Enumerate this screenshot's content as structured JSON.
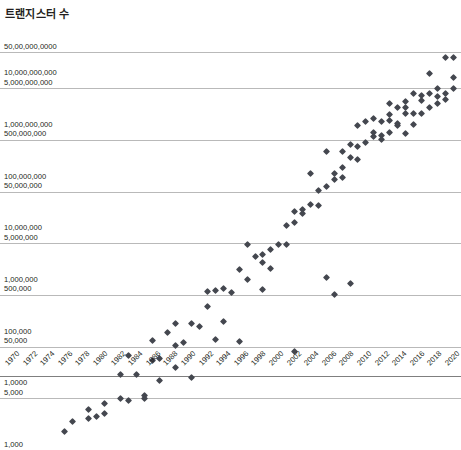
{
  "chart_data": {
    "type": "scatter",
    "title": "트랜지스터 수",
    "xlabel": "",
    "ylabel": "",
    "grid": true,
    "legend": null,
    "y_scale": "log",
    "ylim": [
      1000,
      50000000000
    ],
    "xlim": [
      1970,
      2021
    ],
    "y_tick_labels": [
      "50,00,000,0000",
      "10,000,000,000",
      "5,000,000,000",
      "1,000,000,000",
      "500,000,000",
      "100,000,000",
      "50,000,000",
      "10,000,000",
      "5,000,000",
      "1,000,000",
      "500,000",
      "100,000",
      "50,000",
      "1,0000",
      "5,000",
      "1,000"
    ],
    "y_gridline_values": [
      50000000000,
      10000000000,
      1000000000,
      100000000,
      10000000,
      1000000,
      100000,
      10000
    ],
    "x_tick_labels": [
      "1970",
      "1972",
      "1974",
      "1976",
      "1978",
      "1980",
      "1982",
      "1984",
      "1986",
      "1988",
      "1990",
      "1992",
      "1994",
      "1996",
      "1998",
      "2000",
      "2002",
      "2004",
      "2006",
      "2008",
      "2010",
      "2012",
      "2014",
      "2016",
      "2018",
      "2020"
    ],
    "marker": "diamond",
    "marker_color": "#44474f",
    "points": [
      [
        1971,
        2300
      ],
      [
        1972,
        3500
      ],
      [
        1974,
        4100
      ],
      [
        1974,
        6000
      ],
      [
        1975,
        4500
      ],
      [
        1976,
        8000
      ],
      [
        1976,
        5000
      ],
      [
        1978,
        29000
      ],
      [
        1979,
        9000
      ],
      [
        1979,
        68000
      ],
      [
        1980,
        29000
      ],
      [
        1981,
        11500
      ],
      [
        1982,
        134000
      ],
      [
        1982,
        55000
      ],
      [
        1983,
        22000
      ],
      [
        1984,
        190000
      ],
      [
        1985,
        275000
      ],
      [
        1986,
        120000
      ],
      [
        1987,
        25000
      ],
      [
        1988,
        250000
      ],
      [
        1989,
        1180000
      ],
      [
        1989,
        600000
      ],
      [
        1990,
        1200000
      ],
      [
        1991,
        1350000
      ],
      [
        1992,
        1100000
      ],
      [
        1993,
        3100000
      ],
      [
        1994,
        2000000
      ],
      [
        1994,
        9300000
      ],
      [
        1995,
        5500000
      ],
      [
        1996,
        4300000
      ],
      [
        1996,
        6000000
      ],
      [
        1997,
        7500000
      ],
      [
        1998,
        9500000
      ],
      [
        1999,
        9500000
      ],
      [
        1999,
        22000000
      ],
      [
        2000,
        42000000
      ],
      [
        2000,
        25000000
      ],
      [
        2001,
        45000000
      ],
      [
        2001,
        37500000
      ],
      [
        2002,
        55000000
      ],
      [
        2002,
        220000000
      ],
      [
        2003,
        105000000
      ],
      [
        2003,
        54000000
      ],
      [
        2004,
        592000000
      ],
      [
        2004,
        125000000
      ],
      [
        2005,
        228000000
      ],
      [
        2005,
        169000000
      ],
      [
        2006,
        291000000
      ],
      [
        2006,
        184000000
      ],
      [
        2006,
        582000000
      ],
      [
        2007,
        805000000
      ],
      [
        2007,
        463000000
      ],
      [
        2008,
        731000000
      ],
      [
        2008,
        411000000
      ],
      [
        2008,
        1900000000
      ],
      [
        2009,
        904000000
      ],
      [
        2009,
        2300000000
      ],
      [
        2010,
        1170000000
      ],
      [
        2010,
        2600000000
      ],
      [
        2010,
        1400000000
      ],
      [
        2011,
        2270000000
      ],
      [
        2011,
        1200000000
      ],
      [
        2011,
        995000000
      ],
      [
        2012,
        3100000000
      ],
      [
        2012,
        1400000000
      ],
      [
        2012,
        2400000000
      ],
      [
        2012,
        5000000000
      ],
      [
        2013,
        4310000000
      ],
      [
        2013,
        1860000000
      ],
      [
        2013,
        2100000000
      ],
      [
        2014,
        5560000000
      ],
      [
        2014,
        4200000000
      ],
      [
        2014,
        3200000000
      ],
      [
        2014,
        1300000000
      ],
      [
        2015,
        3300000000
      ],
      [
        2015,
        8000000000
      ],
      [
        2015,
        2000000000
      ],
      [
        2016,
        7200000000
      ],
      [
        2016,
        3300000000
      ],
      [
        2016,
        5700000000
      ],
      [
        2017,
        19200000000
      ],
      [
        2017,
        8000000000
      ],
      [
        2017,
        4300000000
      ],
      [
        2018,
        10000000000
      ],
      [
        2018,
        6900000000
      ],
      [
        2018,
        5000000000
      ],
      [
        2019,
        39540000000
      ],
      [
        2019,
        8000000000
      ],
      [
        2019,
        6000000000
      ],
      [
        2020,
        39500000000
      ],
      [
        2020,
        10000000000
      ],
      [
        2020,
        16000000000
      ],
      [
        1985,
        40000
      ],
      [
        1990,
        140000
      ],
      [
        1993,
        125000
      ],
      [
        2000,
        80000
      ],
      [
        1987,
        275000
      ],
      [
        1991,
        310000
      ],
      [
        1996,
        1300000
      ],
      [
        1997,
        3300000
      ],
      [
        1983,
        60000
      ],
      [
        1985,
        105000
      ],
      [
        2005,
        1000000
      ],
      [
        2004,
        2200000
      ],
      [
        2007,
        1700000
      ],
      [
        1981,
        10000
      ],
      [
        1978,
        10000
      ]
    ]
  }
}
